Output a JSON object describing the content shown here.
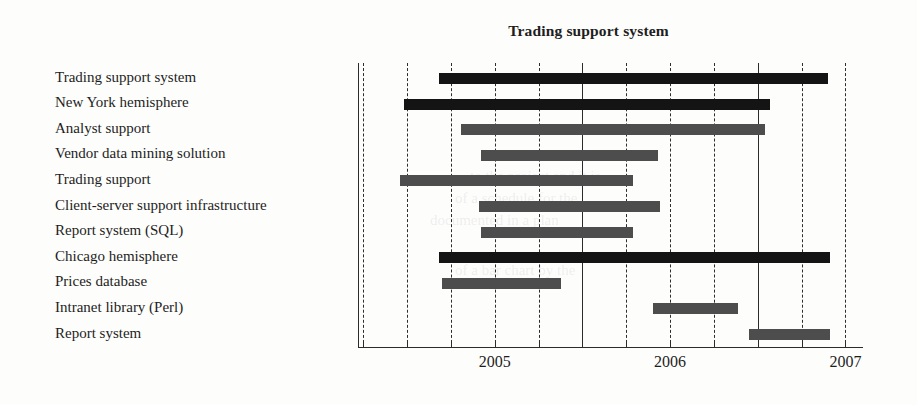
{
  "chart_data": {
    "type": "bar",
    "subtype": "gantt",
    "title": "Trading support system",
    "xlabel": "",
    "ylabel": "",
    "x_tick_labels": [
      "2005",
      "2006",
      "2007"
    ],
    "x_tick_positions": [
      2005.5,
      2006.5,
      2007.5
    ],
    "axis_range": [
      2004.72,
      2007.6
    ],
    "minor_tick_interval_years": 0.25,
    "major_gridlines_at": [
      2006.0,
      2007.0
    ],
    "grid": true,
    "legend": null,
    "bar_colors": {
      "summary": "#141414",
      "task": "#4d4d4d"
    },
    "categories": [
      "Trading support system",
      "New York hemisphere",
      "Analyst support",
      "Vendor data mining solution",
      "Trading support",
      "Client-server support infrastructure",
      "Report system (SQL)",
      "Chicago hemisphere",
      "Prices database",
      "Intranet library (Perl)",
      "Report system"
    ],
    "tasks": [
      {
        "name": "Trading support system",
        "start": 2005.18,
        "end": 2007.4,
        "kind": "summary"
      },
      {
        "name": "New York hemisphere",
        "start": 2004.98,
        "end": 2007.07,
        "kind": "summary"
      },
      {
        "name": "Analyst support",
        "start": 2005.31,
        "end": 2007.04,
        "kind": "task"
      },
      {
        "name": "Vendor data mining solution",
        "start": 2005.42,
        "end": 2006.43,
        "kind": "task"
      },
      {
        "name": "Trading support",
        "start": 2004.96,
        "end": 2006.29,
        "kind": "task"
      },
      {
        "name": "Client-server support infrastructure",
        "start": 2005.41,
        "end": 2006.44,
        "kind": "task"
      },
      {
        "name": "Report system (SQL)",
        "start": 2005.42,
        "end": 2006.29,
        "kind": "task"
      },
      {
        "name": "Chicago hemisphere",
        "start": 2005.18,
        "end": 2007.41,
        "kind": "summary"
      },
      {
        "name": "Prices database",
        "start": 2005.2,
        "end": 2005.88,
        "kind": "task"
      },
      {
        "name": "Intranet library (Perl)",
        "start": 2006.4,
        "end": 2006.89,
        "kind": "task"
      },
      {
        "name": "Report system",
        "start": 2006.95,
        "end": 2007.41,
        "kind": "task"
      }
    ]
  }
}
